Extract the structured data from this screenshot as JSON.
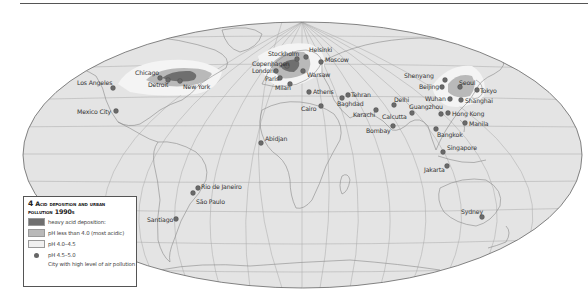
{
  "legend": {
    "number": "4",
    "title_line1": "Acid deposition and urban",
    "title_line2": "pollution 1990s",
    "items": [
      {
        "label": "heavy acid deposition:",
        "color": "#6f6f6f",
        "kind": "swatch"
      },
      {
        "label": "pH less than 4.0 (most acidic)",
        "color": "#b9b9b9",
        "kind": "swatch"
      },
      {
        "label": "pH 4.0–4.5",
        "color": "#f0f0f0",
        "kind": "swatch"
      },
      {
        "label": "pH 4.5–5.0",
        "color": "#6a6a6a",
        "kind": "dot"
      }
    ],
    "note": "City with high level of air pollution"
  },
  "colors": {
    "ocean": "#e4e4e4",
    "land": "#e4e4e4",
    "heavy": "#6f6f6f",
    "most_acidic": "#b9b9b9",
    "moderate": "#f3f3f3",
    "city_dot": "#6a6a6a",
    "graticule": "#a8a8a8",
    "coast": "#8a8a8a"
  },
  "cities": [
    {
      "name": "Los Angeles",
      "x": 113,
      "y": 88,
      "lx": 77,
      "ly": 85,
      "anchor": "start"
    },
    {
      "name": "Mexico City",
      "x": 116,
      "y": 111,
      "lx": 77,
      "ly": 114,
      "anchor": "start"
    },
    {
      "name": "Chicago",
      "x": 160,
      "y": 78,
      "lx": 135,
      "ly": 75,
      "anchor": "start"
    },
    {
      "name": "Detroit",
      "x": 168,
      "y": 80,
      "lx": 148,
      "ly": 87,
      "anchor": "start"
    },
    {
      "name": "New York",
      "x": 180,
      "y": 81,
      "lx": 183,
      "ly": 89,
      "anchor": "start"
    },
    {
      "name": "Stockholm",
      "x": 297,
      "y": 59,
      "lx": 268,
      "ly": 56,
      "anchor": "start"
    },
    {
      "name": "Helsinki",
      "x": 306,
      "y": 57,
      "lx": 309,
      "ly": 52,
      "anchor": "start"
    },
    {
      "name": "Moscow",
      "x": 321,
      "y": 62,
      "lx": 325,
      "ly": 62,
      "anchor": "start"
    },
    {
      "name": "Copenhagen",
      "x": 287,
      "y": 66,
      "lx": 252,
      "ly": 66,
      "anchor": "start"
    },
    {
      "name": "London",
      "x": 276,
      "y": 71,
      "lx": 252,
      "ly": 73,
      "anchor": "start"
    },
    {
      "name": "Paris",
      "x": 280,
      "y": 78,
      "lx": 265,
      "ly": 81,
      "anchor": "start"
    },
    {
      "name": "Warsaw",
      "x": 303,
      "y": 71,
      "lx": 307,
      "ly": 77,
      "anchor": "start"
    },
    {
      "name": "Milan",
      "x": 290,
      "y": 84,
      "lx": 275,
      "ly": 90,
      "anchor": "start"
    },
    {
      "name": "Athens",
      "x": 309,
      "y": 92,
      "lx": 313,
      "ly": 94,
      "anchor": "start"
    },
    {
      "name": "Tehran",
      "x": 348,
      "y": 95,
      "lx": 351,
      "ly": 97,
      "anchor": "start"
    },
    {
      "name": "Baghdad",
      "x": 342,
      "y": 98,
      "lx": 337,
      "ly": 106,
      "anchor": "start"
    },
    {
      "name": "Cairo",
      "x": 321,
      "y": 106,
      "lx": 301,
      "ly": 111,
      "anchor": "start"
    },
    {
      "name": "Karachi",
      "x": 376,
      "y": 110,
      "lx": 353,
      "ly": 117,
      "anchor": "start"
    },
    {
      "name": "Delhi",
      "x": 394,
      "y": 105,
      "lx": 394,
      "ly": 102,
      "anchor": "start"
    },
    {
      "name": "Calcutta",
      "x": 412,
      "y": 113,
      "lx": 382,
      "ly": 119,
      "anchor": "start"
    },
    {
      "name": "Bombay",
      "x": 393,
      "y": 126,
      "lx": 366,
      "ly": 133,
      "anchor": "start"
    },
    {
      "name": "Guangzhou",
      "x": 441,
      "y": 114,
      "lx": 409,
      "ly": 109,
      "anchor": "start"
    },
    {
      "name": "Shenyang",
      "x": 445,
      "y": 80,
      "lx": 404,
      "ly": 78,
      "anchor": "start"
    },
    {
      "name": "Beijing",
      "x": 442,
      "y": 87,
      "lx": 419,
      "ly": 89,
      "anchor": "start"
    },
    {
      "name": "Seoul",
      "x": 460,
      "y": 87,
      "lx": 459,
      "ly": 85,
      "anchor": "start"
    },
    {
      "name": "Tokyo",
      "x": 477,
      "y": 90,
      "lx": 480,
      "ly": 93,
      "anchor": "start"
    },
    {
      "name": "Wuhan",
      "x": 450,
      "y": 99,
      "lx": 425,
      "ly": 101,
      "anchor": "start"
    },
    {
      "name": "Shanghai",
      "x": 461,
      "y": 100,
      "lx": 465,
      "ly": 103,
      "anchor": "start"
    },
    {
      "name": "Hong Kong",
      "x": 448,
      "y": 113,
      "lx": 452,
      "ly": 116,
      "anchor": "start"
    },
    {
      "name": "Manila",
      "x": 465,
      "y": 123,
      "lx": 469,
      "ly": 126,
      "anchor": "start"
    },
    {
      "name": "Bangkok",
      "x": 436,
      "y": 129,
      "lx": 437,
      "ly": 137,
      "anchor": "start"
    },
    {
      "name": "Singapore",
      "x": 443,
      "y": 152,
      "lx": 447,
      "ly": 150,
      "anchor": "start"
    },
    {
      "name": "Jakarta",
      "x": 447,
      "y": 166,
      "lx": 424,
      "ly": 172,
      "anchor": "start"
    },
    {
      "name": "Abidjan",
      "x": 261,
      "y": 143,
      "lx": 265,
      "ly": 141,
      "anchor": "start"
    },
    {
      "name": "Rio de Janeiro",
      "x": 198,
      "y": 188,
      "lx": 201,
      "ly": 189,
      "anchor": "start"
    },
    {
      "name": "São Paulo",
      "x": 193,
      "y": 193,
      "lx": 196,
      "ly": 204,
      "anchor": "start"
    },
    {
      "name": "Santiago",
      "x": 176,
      "y": 219,
      "lx": 147,
      "ly": 222,
      "anchor": "start"
    },
    {
      "name": "Sydney",
      "x": 482,
      "y": 217,
      "lx": 461,
      "ly": 214,
      "anchor": "start"
    }
  ]
}
